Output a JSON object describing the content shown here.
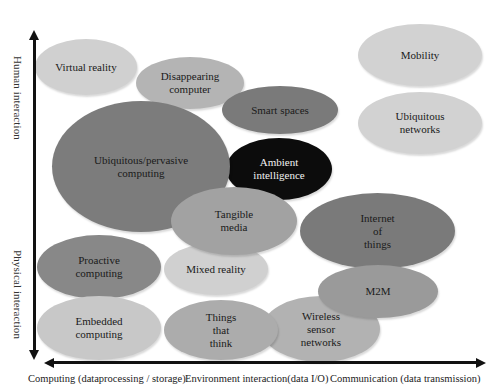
{
  "diagram": {
    "type": "bubble-concept-map",
    "axes": {
      "y_top_label": "Human interaction",
      "y_bottom_label": "Physical  interaction",
      "x_labels": [
        "Computing (dataprocessing / storage)",
        "Environment interaction(data I/O)",
        "Communication (data transmission)"
      ]
    },
    "concepts": [
      {
        "label": "Virtual reality",
        "color": "#d0d0d0",
        "text_color": "#1a1a1a"
      },
      {
        "label": "Disappearing\ncomputer",
        "color": "#b4b4b4",
        "text_color": "#1a1a1a"
      },
      {
        "label": "Mobility",
        "color": "#d2d2d2",
        "text_color": "#1a1a1a"
      },
      {
        "label": "Smart spaces",
        "color": "#7a7a7a",
        "text_color": "#1a1a1a"
      },
      {
        "label": "Ubiquitous\nnetworks",
        "color": "#d2d2d2",
        "text_color": "#1a1a1a"
      },
      {
        "label": "Ubiquitous/pervasive\ncomputing",
        "color": "#7c7c7c",
        "text_color": "#1a1a1a"
      },
      {
        "label": "Ambient\nintelligence",
        "color": "#0c0c0c",
        "text_color": "#f2f2f2"
      },
      {
        "label": "Tangible\nmedia",
        "color": "#a2a2a2",
        "text_color": "#1a1a1a"
      },
      {
        "label": "Internet\nof\nthings",
        "color": "#7a7a7a",
        "text_color": "#1a1a1a"
      },
      {
        "label": "Proactive\ncomputing",
        "color": "#888888",
        "text_color": "#1a1a1a"
      },
      {
        "label": "Mixed reality",
        "color": "#d0d0d0",
        "text_color": "#1a1a1a"
      },
      {
        "label": "M2M",
        "color": "#9a9a9a",
        "text_color": "#1a1a1a"
      },
      {
        "label": "Embedded\ncomputing",
        "color": "#c8c8c8",
        "text_color": "#1a1a1a"
      },
      {
        "label": "Things\nthat\nthink",
        "color": "#acacac",
        "text_color": "#1a1a1a"
      },
      {
        "label": "Wireless\nsensor\nnetworks",
        "color": "#b2b2b2",
        "text_color": "#1a1a1a"
      }
    ]
  }
}
